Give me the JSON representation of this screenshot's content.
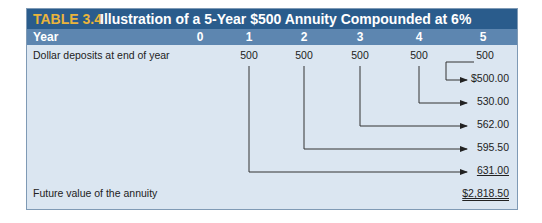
{
  "table": {
    "number": "TABLE 3.4",
    "title": "Illustration of a 5-Year $500 Annuity Compounded at 6%",
    "header": {
      "label": "Year",
      "years": [
        "0",
        "1",
        "2",
        "3",
        "4",
        "5"
      ]
    },
    "deposits_row": {
      "label": "Dollar deposits at end of year",
      "values": [
        "500",
        "500",
        "500",
        "500",
        "500"
      ]
    },
    "future_values": [
      "$500.00",
      "530.00",
      "562.00",
      "595.50",
      "631.00"
    ],
    "total_row": {
      "label": "Future value of the annuity",
      "value": "$2,818.50"
    }
  },
  "colors": {
    "title_bar": "#2a5c8c",
    "title_number": "#e9b43c",
    "year_row": "#5d86b0",
    "body": "#dbe6f1"
  }
}
